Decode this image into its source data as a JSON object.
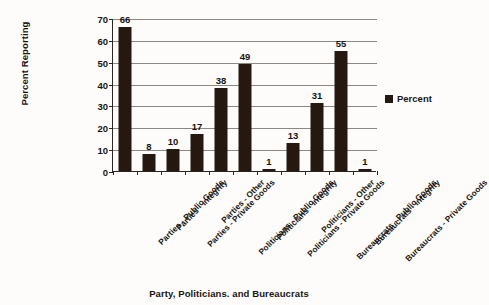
{
  "chart_data": {
    "type": "bar",
    "title": "",
    "xlabel": "Party, Politicians. and Bureaucrats",
    "ylabel": "Percent Reporting",
    "categories": [
      "Parties - Public Goods",
      "Parties - Integrity",
      "Parties - Private Goods",
      "Parties - Other",
      "Politicians - Public Goods",
      "Politicians - Integrity",
      "Politicians - Private Goods",
      "Politicians - Other",
      "Bureaucrats - Public Goods",
      "Bureaucrats - Integrity",
      "Bureaucrats - Private Goods"
    ],
    "values": [
      66,
      8,
      10,
      17,
      38,
      49,
      1,
      13,
      31,
      55,
      1
    ],
    "series": [
      {
        "name": "Percent",
        "values": [
          66,
          8,
          10,
          17,
          38,
          49,
          1,
          13,
          31,
          55,
          1
        ]
      }
    ],
    "ylim": [
      0,
      70
    ],
    "ytick_labels": [
      "0",
      "10",
      "20",
      "30",
      "40",
      "50",
      "60",
      "70"
    ],
    "ytick_values": [
      0,
      10,
      20,
      30,
      40,
      50,
      60,
      70
    ],
    "grid": "horizontal",
    "legend_position": "right",
    "bar_color": "#251810",
    "gridline_color": "#8d8881",
    "axis_color": "#2b2622",
    "background_color": "#fdfcfa"
  },
  "legend": {
    "entries": [
      {
        "label": "Percent",
        "color": "#251810"
      }
    ]
  }
}
